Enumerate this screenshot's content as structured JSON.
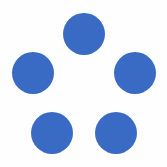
{
  "diagram": {
    "shape": "pentagon-of-dots",
    "dot_color": "#3a6bc4",
    "background": "#fefefe",
    "dots": [
      {
        "name": "top",
        "cx": 84,
        "cy": 34,
        "r": 21
      },
      {
        "name": "middle-left",
        "cx": 33,
        "cy": 73,
        "r": 21
      },
      {
        "name": "middle-right",
        "cx": 135,
        "cy": 73,
        "r": 21
      },
      {
        "name": "bottom-left",
        "cx": 52,
        "cy": 133,
        "r": 21
      },
      {
        "name": "bottom-right",
        "cx": 116,
        "cy": 133,
        "r": 21
      }
    ]
  }
}
